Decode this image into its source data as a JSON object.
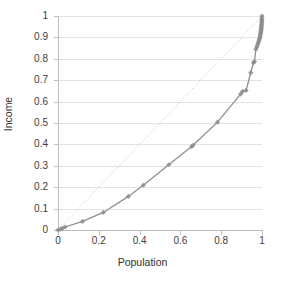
{
  "chart_data": {
    "type": "line",
    "title": "",
    "xlabel": "Population",
    "ylabel": "Income",
    "xlim": [
      0,
      1
    ],
    "ylim": [
      0,
      1
    ],
    "grid": true,
    "legend": false,
    "x_ticks": [
      "0",
      "0.2",
      "0.4",
      "0.6",
      "0.8",
      "1"
    ],
    "x_tick_values": [
      0,
      0.2,
      0.4,
      0.6,
      0.8,
      1
    ],
    "y_ticks": [
      "0",
      "0.1",
      "0.2",
      "0.3",
      "0.4",
      "0.5",
      "0.6",
      "0.7",
      "0.8",
      "0.9",
      "1"
    ],
    "y_tick_values": [
      0,
      0.1,
      0.2,
      0.3,
      0.4,
      0.5,
      0.6,
      0.7,
      0.8,
      0.9,
      1
    ],
    "series": [
      {
        "name": "Lorenz curve",
        "marker": "diamond",
        "color": "#8c8c8c",
        "line_color": "#8c8c8c",
        "x": [
          0.0,
          0.012,
          0.022,
          0.035,
          0.12,
          0.222,
          0.345,
          0.418,
          0.543,
          0.655,
          0.662,
          0.782,
          0.895,
          0.905,
          0.922,
          0.945,
          0.958,
          0.963,
          0.97,
          0.974,
          0.978,
          0.981,
          0.984,
          0.986,
          0.988,
          0.99,
          0.991,
          0.992,
          0.993,
          0.994,
          0.995,
          0.996,
          0.9965,
          0.997,
          0.9975,
          0.998,
          0.9985,
          0.999,
          0.9993,
          0.9996,
          1.0
        ],
        "y": [
          0.0,
          0.004,
          0.008,
          0.014,
          0.04,
          0.082,
          0.157,
          0.209,
          0.305,
          0.39,
          0.396,
          0.504,
          0.635,
          0.648,
          0.652,
          0.735,
          0.782,
          0.787,
          0.845,
          0.855,
          0.865,
          0.873,
          0.881,
          0.888,
          0.895,
          0.901,
          0.907,
          0.913,
          0.919,
          0.925,
          0.931,
          0.937,
          0.943,
          0.949,
          0.955,
          0.962,
          0.969,
          0.976,
          0.983,
          0.991,
          1.0
        ]
      },
      {
        "name": "Line of equality",
        "style": "dotted",
        "color": "#cfcfcf",
        "x": [
          0,
          1
        ],
        "y": [
          0,
          1
        ]
      }
    ]
  },
  "axes": {
    "x_title": "Population",
    "y_title": "Income"
  }
}
